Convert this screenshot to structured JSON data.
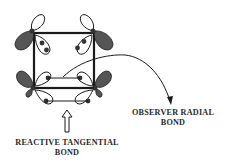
{
  "diagram": {
    "colors": {
      "line": "#1a1a1a",
      "filled_lobe": "#555555",
      "background": "#ffffff"
    },
    "labels": {
      "observer": {
        "line1": "OBSERVER RADIAL",
        "line2": "BOND"
      },
      "reactive": {
        "line1": "REACTIVE TANGENTIAL",
        "line2": "BOND"
      }
    },
    "elements": [
      {
        "type": "square-frame",
        "corners": 4
      },
      {
        "type": "orbital-lobes",
        "per_corner": [
          "filled-outward",
          "open-vertical",
          "open-inward-with-electrons"
        ]
      },
      {
        "type": "curved-arrow",
        "points_to": "observer-label"
      },
      {
        "type": "hollow-up-arrow",
        "points_to": "reactive-bond"
      }
    ]
  }
}
